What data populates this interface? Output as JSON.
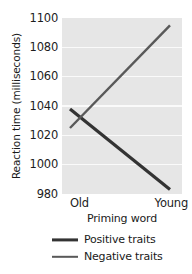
{
  "chart_data": {
    "type": "line",
    "title": "",
    "xlabel": "Priming word",
    "ylabel": "Reaction time (milliseconds)",
    "categories": [
      "Old",
      "Young"
    ],
    "xtick_labels": [
      "Old",
      "Young"
    ],
    "ytick_labels": [
      "980",
      "1000",
      "1020",
      "1040",
      "1060",
      "1080",
      "1100"
    ],
    "ytick_values": [
      980,
      1000,
      1020,
      1040,
      1060,
      1080,
      1100
    ],
    "ylim": [
      980,
      1100
    ],
    "grid": true,
    "grid_axis": "y",
    "legend_position": "below",
    "plot_background": "#e6e6e6",
    "gridline_color": "#fafafa",
    "series": [
      {
        "name": "Positive traits",
        "values": [
          1038,
          983
        ],
        "color": "#333333",
        "linewidth": 3.2
      },
      {
        "name": "Negative traits",
        "values": [
          1025,
          1095
        ],
        "color": "#595959",
        "linewidth": 2.4
      }
    ],
    "legend_entries": [
      "Positive traits",
      "Negative traits"
    ]
  }
}
